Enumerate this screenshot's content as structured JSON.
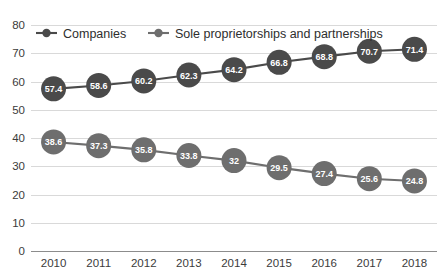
{
  "chart_data": {
    "type": "line",
    "title": "",
    "subtitle": "",
    "xlabel": "",
    "ylabel": "",
    "categories": [
      "2010",
      "2011",
      "2012",
      "2013",
      "2014",
      "2015",
      "2016",
      "2017",
      "2018"
    ],
    "series": [
      {
        "name": "Companies",
        "color": "#4a4a4a",
        "values": [
          57.4,
          58.6,
          60.2,
          62.3,
          64.2,
          66.8,
          68.8,
          70.7,
          71.4
        ],
        "labels": [
          "57.4",
          "58.6",
          "60.2",
          "62.3",
          "64.2",
          "66.8",
          "68.8",
          "70.7",
          "71.4"
        ]
      },
      {
        "name": "Sole proprietorships and partnerships",
        "color": "#6e6e6e",
        "values": [
          38.6,
          37.3,
          35.8,
          33.8,
          32,
          29.5,
          27.4,
          25.6,
          24.8
        ],
        "labels": [
          "38.6",
          "37.3",
          "35.8",
          "33.8",
          "32",
          "29.5",
          "27.4",
          "25.6",
          "24.8"
        ]
      }
    ],
    "ylim": [
      0,
      80
    ],
    "yticks": [
      0,
      10,
      20,
      30,
      40,
      50,
      60,
      70,
      80
    ],
    "ytick_labels": [
      "0",
      "10",
      "20",
      "30",
      "40",
      "50",
      "60",
      "70",
      "80"
    ],
    "grid": true,
    "grid_color": "#d9d9d9",
    "legend_position": "top-left",
    "data_labels": true,
    "marker_shape": "circle",
    "background_color": "#ffffff"
  },
  "legend": {
    "entries": [
      {
        "label": "Companies",
        "color": "#4a4a4a"
      },
      {
        "label": "Sole proprietorships and partnerships",
        "color": "#6e6e6e"
      }
    ]
  }
}
